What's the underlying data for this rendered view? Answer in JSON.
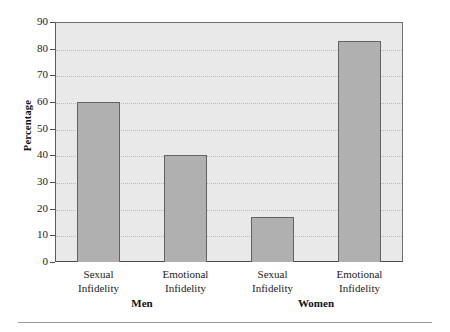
{
  "chart_data": {
    "type": "bar",
    "title": "",
    "xlabel": "",
    "ylabel": "Percentage",
    "ylim": [
      0,
      90
    ],
    "ytick_step": 10,
    "yticks": [
      0,
      10,
      20,
      30,
      40,
      50,
      60,
      70,
      80,
      90
    ],
    "ytick_labels": [
      "0",
      "10",
      "20",
      "30",
      "40",
      "50",
      "60",
      "70",
      "80",
      "90"
    ],
    "grid": true,
    "grid_axis": "y",
    "grid_style": "dotted",
    "legend": false,
    "categories": [
      "Sexual Infidelity",
      "Emotional Infidelity",
      "Sexual Infidelity",
      "Emotional Infidelity"
    ],
    "category_lines": [
      [
        "Sexual",
        "Infidelity"
      ],
      [
        "Emotional",
        "Infidelity"
      ],
      [
        "Sexual",
        "Infidelity"
      ],
      [
        "Emotional",
        "Infidelity"
      ]
    ],
    "groups": [
      {
        "label": "Men",
        "categories": [
          "Sexual Infidelity",
          "Emotional Infidelity"
        ],
        "values": [
          60,
          40
        ]
      },
      {
        "label": "Women",
        "categories": [
          "Sexual Infidelity",
          "Emotional Infidelity"
        ],
        "values": [
          17,
          83
        ]
      }
    ],
    "values": [
      60,
      40,
      17,
      83
    ],
    "bar_color": "#b0b0b0",
    "bar_edge_color": "#636363",
    "plot_background": "#e9e9e9"
  }
}
